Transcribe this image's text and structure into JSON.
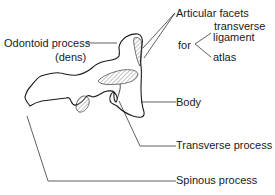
{
  "diagram": {
    "labels": {
      "odontoid_process": "Odontoid process",
      "odontoid_alt": "(dens)",
      "articular_facets": "Articular facets",
      "for": "for",
      "transverse_ligament_1": "transverse",
      "transverse_ligament_2": "ligament",
      "atlas": "atlas",
      "body": "Body",
      "transverse_process": "Transverse process",
      "spinous_process": "Spinous process"
    },
    "colors": {
      "line": "#1a1a1a",
      "hatch": "#8a8a8a",
      "background": "#ffffff"
    }
  }
}
